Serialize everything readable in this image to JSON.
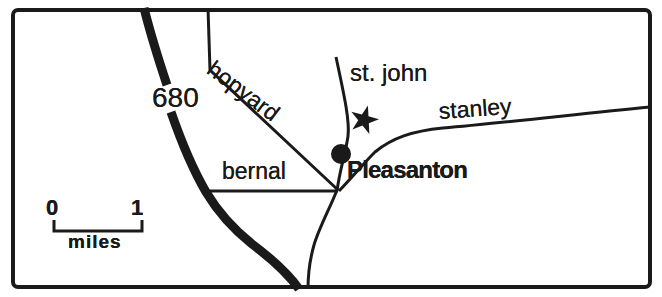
{
  "map": {
    "city": {
      "label": "Pleasanton"
    },
    "roads": {
      "freeway": {
        "label": "680"
      },
      "hopyard": {
        "label": "hopyard"
      },
      "st_john": {
        "label": "st. john"
      },
      "stanley": {
        "label": "stanley"
      },
      "bernal": {
        "label": "bernal"
      }
    },
    "markers": {
      "star_icon": "star-marker",
      "dot_icon": "city-location-dot"
    },
    "scale": {
      "start_label": "0",
      "end_label": "1",
      "unit_label": "miles"
    },
    "colors": {
      "ink": "#1a1a1a",
      "paper": "#ffffff"
    }
  }
}
